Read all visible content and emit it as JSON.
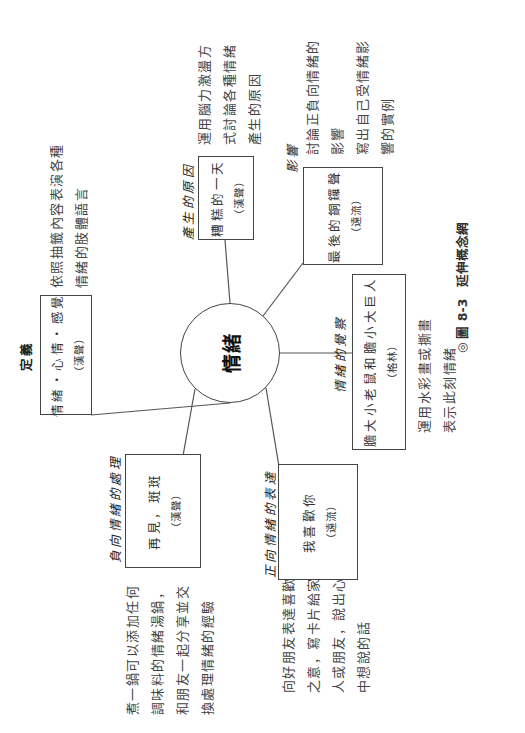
{
  "concept_map": {
    "center": "情緒",
    "branches": [
      {
        "id": "definition",
        "label": "定義",
        "book_title": "情緒・心情・感覺",
        "book_author": "（漢聲）",
        "activity": [
          "依照抽籤內容表演各種",
          "情緒的肢體語言"
        ]
      },
      {
        "id": "cause",
        "label": "產生的原因",
        "book_title": "糟糕的一天",
        "book_author": "（漢聲）",
        "activity": [
          "運用腦力激盪方",
          "式討論各種情緒",
          "產生的原因"
        ]
      },
      {
        "id": "impact",
        "label": "影響",
        "book_title": "最後的銅鑼聲",
        "book_author": "（遠流）",
        "activity": [
          "討論正負向情緒的",
          "影響",
          "寫出自己受情緒影",
          "響的實例"
        ]
      },
      {
        "id": "awareness",
        "label": "情緒的覺察",
        "book_title": "膽大小老鼠和膽小大巨人",
        "book_author": "（格林）",
        "activity": [
          "運用水彩畫或撕畫",
          "表示此刻情緒"
        ]
      },
      {
        "id": "positive",
        "label": "正向情緒的表達",
        "book_title": "我喜歡你",
        "book_author": "（遠流）",
        "activity": [
          "向好朋友表達喜歡",
          "之意，寫卡片給家",
          "人或朋友，說出心",
          "中想說的話"
        ]
      },
      {
        "id": "negative",
        "label": "負向情緒的處理",
        "book_title": "再見，斑斑",
        "book_author": "（漢聲）",
        "activity": [
          "煮一鍋可以添加任何",
          "調味料的情緒湯鍋，",
          "和朋友一起分享並交",
          "換處理情緒的經驗"
        ]
      }
    ]
  },
  "caption": {
    "symbol": "◎",
    "figure_number": "圖 8-3",
    "title": "延伸概念網"
  }
}
